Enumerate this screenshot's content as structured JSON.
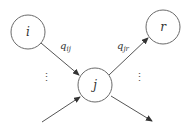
{
  "diagram": {
    "type": "node-transition-graph",
    "nodes": [
      {
        "id": "i",
        "label": "i",
        "cx": 28,
        "cy": 32,
        "r": 17
      },
      {
        "id": "j",
        "label": "j",
        "cx": 95,
        "cy": 85,
        "r": 17
      },
      {
        "id": "r",
        "label": "r",
        "cx": 163,
        "cy": 27,
        "r": 17
      }
    ],
    "edges": [
      {
        "from": "i",
        "to": "j",
        "label_main": "q",
        "label_sub": "ij"
      },
      {
        "from": "j",
        "to": "r",
        "label_main": "q",
        "label_sub": "jr"
      },
      {
        "from": "external",
        "to": "j",
        "label_main": "",
        "label_sub": ""
      },
      {
        "from": "j",
        "to": "external",
        "label_main": "",
        "label_sub": ""
      }
    ],
    "ellipsis_left": "⋮",
    "ellipsis_right": "⋮",
    "colors": {
      "stroke": "#6a6a6a",
      "text": "#333333",
      "background": "#ffffff"
    }
  }
}
